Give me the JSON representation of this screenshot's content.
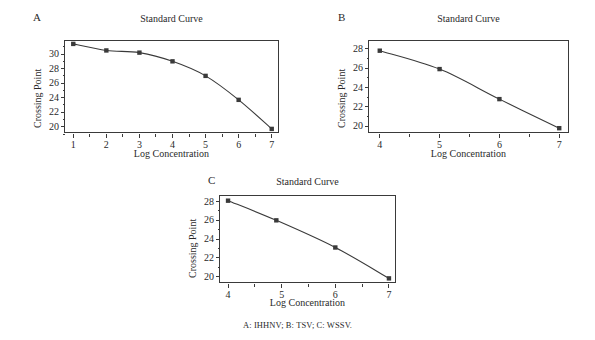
{
  "figure": {
    "caption": "A: IHHNV; B: TSV; C: WSSV.",
    "panels": [
      {
        "letter": "A",
        "title": "Standard Curve",
        "xlabel": "Log Concentration",
        "ylabel": "Crossing Point"
      },
      {
        "letter": "B",
        "title": "Standard Curve",
        "xlabel": "Log Concentration",
        "ylabel": "Crossing Point"
      },
      {
        "letter": "C",
        "title": "Standard Curve",
        "xlabel": "Log Concentration",
        "ylabel": "Crossing Point"
      }
    ]
  },
  "chart_data": [
    {
      "type": "line",
      "panel": "A",
      "title": "Standard Curve",
      "xlabel": "Log Concentration",
      "ylabel": "Crossing Point",
      "x": [
        1,
        2,
        3,
        4,
        5,
        6,
        7
      ],
      "values": [
        31.4,
        30.5,
        30.2,
        29.0,
        27.0,
        23.7,
        19.7
      ],
      "xlim": [
        0.75,
        7.25
      ],
      "ylim": [
        19.0,
        31.8
      ],
      "xticks": [
        1,
        2,
        3,
        4,
        5,
        6,
        7
      ],
      "xtick_labels": [
        "1",
        "2",
        "3",
        "4",
        "5",
        "6",
        "7"
      ],
      "yticks": [
        20,
        22,
        24,
        26,
        28,
        30
      ],
      "ytick_labels": [
        "20",
        "22",
        "24",
        "26",
        "28",
        "30"
      ],
      "grid": false,
      "legend": false,
      "marker": "square",
      "line_color": "#3a3a3a",
      "marker_color": "#3a3a3a"
    },
    {
      "type": "line",
      "panel": "B",
      "title": "Standard Curve",
      "xlabel": "Log Concentration",
      "ylabel": "Crossing Point",
      "x": [
        4,
        5,
        6,
        7
      ],
      "values": [
        27.8,
        25.9,
        22.8,
        19.8
      ],
      "xlim": [
        3.82,
        7.18
      ],
      "ylim": [
        19.2,
        28.8
      ],
      "xticks": [
        4,
        5,
        6,
        7
      ],
      "xtick_labels": [
        "4",
        "5",
        "6",
        "7"
      ],
      "yticks": [
        20,
        22,
        24,
        26,
        28
      ],
      "ytick_labels": [
        "20",
        "22",
        "24",
        "26",
        "28"
      ],
      "grid": false,
      "legend": false,
      "marker": "square",
      "line_color": "#3a3a3a",
      "marker_color": "#3a3a3a"
    },
    {
      "type": "line",
      "panel": "C",
      "title": "Standard Curve",
      "xlabel": "Log Concentration",
      "ylabel": "Crossing Point",
      "x": [
        4,
        4.9,
        6,
        7
      ],
      "values": [
        28.1,
        26.0,
        23.1,
        19.8
      ],
      "xlim": [
        3.85,
        7.15
      ],
      "ylim": [
        19.2,
        28.6
      ],
      "xticks": [
        4,
        5,
        6,
        7
      ],
      "xtick_labels": [
        "4",
        "5",
        "6",
        "7"
      ],
      "yticks": [
        20,
        22,
        24,
        26,
        28
      ],
      "ytick_labels": [
        "20",
        "22",
        "24",
        "26",
        "28"
      ],
      "grid": false,
      "legend": false,
      "marker": "square",
      "line_color": "#3a3a3a",
      "marker_color": "#3a3a3a"
    }
  ]
}
